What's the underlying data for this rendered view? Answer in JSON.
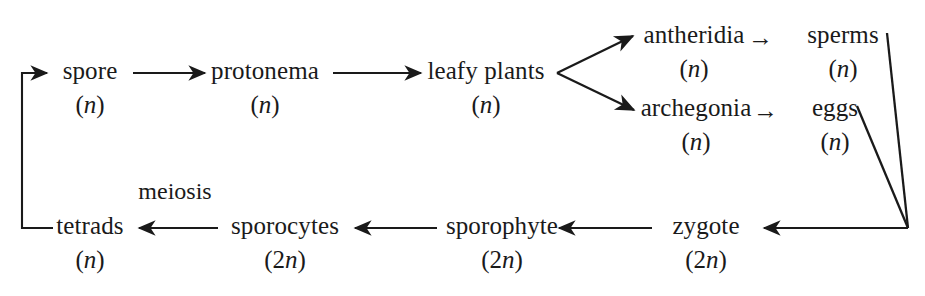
{
  "diagram": {
    "background_color": "#ffffff",
    "ink_color": "#1a1a1a",
    "nodes": [
      {
        "id": "spore",
        "label": "spore",
        "ploidy": "(n)",
        "x": 90,
        "y": 73
      },
      {
        "id": "protonema",
        "label": "protonema",
        "ploidy": "(n)",
        "x": 265,
        "y": 73
      },
      {
        "id": "leafy",
        "label": "leafy plants",
        "ploidy": "(n)",
        "x": 486,
        "y": 73
      },
      {
        "id": "antheridia",
        "label": "antheridia",
        "ploidy": "(n)",
        "x": 694,
        "y": 37
      },
      {
        "id": "sperms",
        "label": "sperms",
        "ploidy": "(n)",
        "x": 843,
        "y": 37
      },
      {
        "id": "archegonia",
        "label": "archegonia",
        "ploidy": "(n)",
        "x": 696,
        "y": 110
      },
      {
        "id": "eggs",
        "label": "eggs",
        "ploidy": "(n)",
        "x": 835,
        "y": 110
      },
      {
        "id": "zygote",
        "label": "zygote",
        "ploidy": "(2n)",
        "x": 706,
        "y": 228
      },
      {
        "id": "sporophyte",
        "label": "sporophyte",
        "ploidy": "(2n)",
        "x": 502,
        "y": 228
      },
      {
        "id": "sporocytes",
        "label": "sporocytes",
        "ploidy": "(2n)",
        "x": 285,
        "y": 228
      },
      {
        "id": "tetrads",
        "label": "tetrads",
        "ploidy": "(n)",
        "x": 90,
        "y": 228
      }
    ],
    "labels": [
      {
        "id": "meiosis",
        "text": "meiosis",
        "x": 175,
        "y": 196
      }
    ],
    "inline_arrows": [
      {
        "id": "antheridia-to-sperms",
        "glyph": "→",
        "x": 755,
        "y": 37
      },
      {
        "id": "archegonia-to-eggs",
        "glyph": "→",
        "x": 760,
        "y": 110
      }
    ],
    "edges": [
      {
        "id": "spore-to-protonema",
        "from": "spore",
        "to": "protonema",
        "kind": "straight-arrow"
      },
      {
        "id": "protonema-to-leafy",
        "from": "protonema",
        "to": "leafy",
        "kind": "straight-arrow"
      },
      {
        "id": "leafy-to-antheridia",
        "from": "leafy",
        "to": "antheridia",
        "kind": "diagonal-arrow"
      },
      {
        "id": "leafy-to-archegonia",
        "from": "leafy",
        "to": "archegonia",
        "kind": "diagonal-arrow"
      },
      {
        "id": "sperms-to-junction",
        "from": "sperms",
        "to": "junction",
        "kind": "plain-line"
      },
      {
        "id": "eggs-to-junction",
        "from": "eggs",
        "to": "junction",
        "kind": "plain-line"
      },
      {
        "id": "junction-to-zygote",
        "from": "junction",
        "to": "zygote",
        "kind": "straight-arrow"
      },
      {
        "id": "zygote-to-sporophyte",
        "from": "zygote",
        "to": "sporophyte",
        "kind": "straight-arrow"
      },
      {
        "id": "sporophyte-to-sporocytes",
        "from": "sporophyte",
        "to": "sporocytes",
        "kind": "straight-arrow"
      },
      {
        "id": "sporocytes-to-tetrads",
        "from": "sporocytes",
        "to": "tetrads",
        "kind": "straight-arrow",
        "annotation": "meiosis"
      },
      {
        "id": "tetrads-to-spore",
        "from": "tetrads",
        "to": "spore",
        "kind": "bracket-arrow"
      }
    ]
  }
}
